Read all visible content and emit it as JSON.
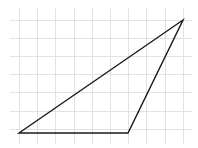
{
  "diagram": {
    "type": "triangle-on-grid",
    "background": "#ffffff",
    "grid": {
      "color": "#e2e2e2",
      "origin_px": [
        19,
        19.5
      ],
      "spacing_px": 18.2,
      "columns": 10,
      "rows": 7,
      "extent_px": {
        "x0": 10,
        "x1": 192,
        "y0": 8,
        "y1": 144
      }
    },
    "triangle": {
      "stroke": "#1a1a1a",
      "vertices_grid": [
        [
          0,
          6
        ],
        [
          6,
          6
        ],
        [
          9,
          0
        ]
      ],
      "vertices_px": [
        [
          19,
          133
        ],
        [
          128,
          133
        ],
        [
          183,
          20
        ]
      ]
    }
  }
}
